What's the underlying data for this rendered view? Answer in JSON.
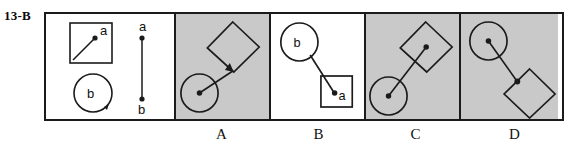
{
  "item": {
    "number_label": "13-B"
  },
  "colors": {
    "shaded_panel": "#c9c9c9",
    "plain_panel": "#ffffff",
    "ink": "#1b1b1b",
    "frame": "#1b1b1b"
  },
  "stimulus_panel": {
    "name": "stimulus",
    "background": "plain",
    "objects": [
      {
        "kind": "square",
        "label": "a",
        "note": "upright square containing a diagonal arrow from lower-left corner to a dot near center, dot labeled a"
      },
      {
        "kind": "circle",
        "label": "b",
        "note": "circle with arrowhead on its lower-right circumference indicating rotation, labeled b inside"
      },
      {
        "kind": "segment",
        "top_label": "a",
        "bottom_label": "b",
        "note": "vertical line segment with dots at both ends; a at top, b at bottom"
      }
    ]
  },
  "options": [
    {
      "id": "A",
      "letter": "A",
      "background": "shaded",
      "shapes": {
        "square": "rotated square, upper right",
        "circle": "circle with center dot, lower left",
        "connector": "line from circle center to arrowhead at square's lower corner"
      }
    },
    {
      "id": "B",
      "letter": "B",
      "background": "plain",
      "shapes": {
        "circle": "circle labeled b, upper left",
        "square": "upright square containing dot labeled a, lower right",
        "connector": "line from circle edge to arrowhead at dot a inside the square"
      }
    },
    {
      "id": "C",
      "letter": "C",
      "background": "shaded",
      "shapes": {
        "square": "rotated square with center dot, upper right",
        "circle": "circle with center dot, lower left",
        "connector": "line joining the two center dots"
      }
    },
    {
      "id": "D",
      "letter": "D",
      "background": "shaded",
      "shapes": {
        "circle": "circle with center dot, upper left",
        "square": "rotated square, lower right, with dot at its upper-left corner",
        "connector": "line joining circle center dot to the square corner dot"
      }
    }
  ],
  "labels": {
    "a": "a",
    "b": "b"
  }
}
